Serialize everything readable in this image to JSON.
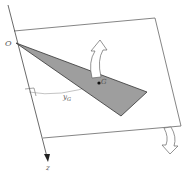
{
  "diagram": {
    "labels": {
      "origin": "O",
      "point": "G",
      "distance": "y",
      "distance_sub": "G",
      "axis": "z"
    },
    "colors": {
      "line": "#555555",
      "plate_fill": "#9e9e9e",
      "plate_stroke": "#333333",
      "arrow_fill": "#ffffff",
      "arrow_stroke": "#666666"
    },
    "elements": [
      {
        "type": "plane",
        "description": "tilted rectangular plane"
      },
      {
        "type": "triangle",
        "description": "shaded triangular plate with vertex at O"
      },
      {
        "type": "point",
        "label": "G"
      },
      {
        "type": "dimension",
        "label": "yG"
      },
      {
        "type": "axis",
        "label": "z"
      },
      {
        "type": "rotation-arrow",
        "direction": "up"
      },
      {
        "type": "rotation-arrow",
        "direction": "down"
      }
    ]
  }
}
